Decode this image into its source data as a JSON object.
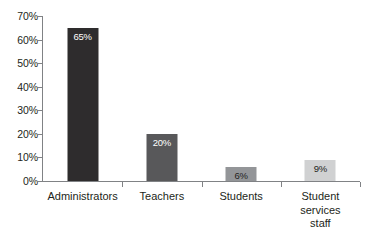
{
  "chart_data": {
    "type": "bar",
    "title": "",
    "subtitle": "",
    "xlabel": "",
    "ylabel": "",
    "categories": [
      "Administrators",
      "Teachers",
      "Students",
      "Student services staff"
    ],
    "values": [
      65,
      20,
      6,
      9
    ],
    "data_labels": [
      "65%",
      "20%",
      "6%",
      "9%"
    ],
    "ylim": [
      0,
      70
    ],
    "ytick_values": [
      0,
      10,
      20,
      30,
      40,
      50,
      60,
      70
    ],
    "ytick_labels": [
      "0%",
      "10%",
      "20%",
      "30%",
      "40%",
      "50%",
      "60%",
      "70%"
    ],
    "grid": false,
    "legend": false,
    "legend_position": "none",
    "bar_colors": [
      "#2e2c2d",
      "#58585a",
      "#939598",
      "#d0d1d2"
    ],
    "label_text_colors": [
      "#ffffff",
      "#ffffff",
      "#231f20",
      "#231f20"
    ],
    "axis_color": "#808285",
    "background_color": "#ffffff",
    "series": [
      {
        "name": "Percent",
        "values": [
          65,
          20,
          6,
          9
        ]
      }
    ],
    "points": [
      {
        "category": "Administrators",
        "value": 65,
        "label": "65%"
      },
      {
        "category": "Teachers",
        "value": 20,
        "label": "20%"
      },
      {
        "category": "Students",
        "value": 6,
        "label": "6%"
      },
      {
        "category": "Student services staff",
        "value": 9,
        "label": "9%"
      }
    ],
    "category_label_lines": [
      [
        "Administrators"
      ],
      [
        "Teachers"
      ],
      [
        "Students"
      ],
      [
        "Student services",
        "staff"
      ]
    ]
  }
}
